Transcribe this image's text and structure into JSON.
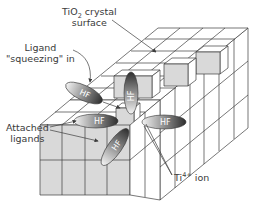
{
  "labels": {
    "surface_line1_prefix": "TiO",
    "surface_line1_sub": "2",
    "surface_line1_suffix": " crystal",
    "surface_line2": "surface",
    "ligand_line1": "Ligand",
    "ligand_line2": "\"squeezing\" in",
    "attached_line1": "Attached",
    "attached_line2": "ligands",
    "ion_prefix": "Ti",
    "ion_sup": "4+",
    "ion_suffix": " ion"
  },
  "ligands": [
    {
      "id": "squeezing",
      "text": "HF"
    },
    {
      "id": "vertical-top",
      "text": "HF"
    },
    {
      "id": "attached-left",
      "text": "HF"
    },
    {
      "id": "attached-diagonal",
      "text": "HF"
    },
    {
      "id": "attached-right",
      "text": "HF"
    }
  ],
  "colors": {
    "grey_face": "#d9d9d9",
    "line": "#3d3d3d",
    "ligand_dark": "#333333",
    "ligand_light": "#f2f2f2"
  }
}
